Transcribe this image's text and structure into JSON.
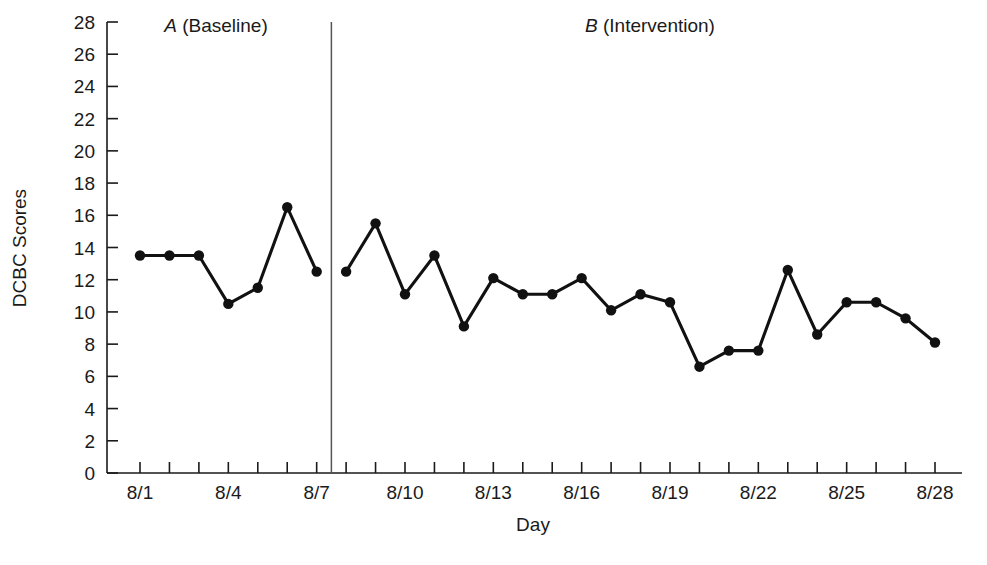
{
  "chart_data": {
    "type": "line",
    "title": "",
    "xlabel": "Day",
    "ylabel": "DCBC Scores",
    "ylim": [
      0,
      28
    ],
    "ytick_step": 2,
    "yticks": [
      0,
      2,
      4,
      6,
      8,
      10,
      12,
      14,
      16,
      18,
      20,
      22,
      24,
      26,
      28
    ],
    "ytick_labels": [
      "0",
      "2",
      "4",
      "6",
      "8",
      "10",
      "12",
      "14",
      "16",
      "18",
      "20",
      "22",
      "24",
      "26",
      "28"
    ],
    "x": [
      "8/1",
      "8/2",
      "8/3",
      "8/4",
      "8/5",
      "8/6",
      "8/7",
      "8/8",
      "8/9",
      "8/10",
      "8/11",
      "8/12",
      "8/13",
      "8/14",
      "8/15",
      "8/16",
      "8/17",
      "8/18",
      "8/19",
      "8/20",
      "8/21",
      "8/22",
      "8/23",
      "8/24",
      "8/25",
      "8/26",
      "8/27",
      "8/28"
    ],
    "xtick_labels": [
      "8/1",
      "",
      "",
      "8/4",
      "",
      "",
      "8/7",
      "",
      "",
      "8/10",
      "",
      "",
      "8/13",
      "",
      "",
      "8/16",
      "",
      "",
      "8/19",
      "",
      "",
      "8/22",
      "",
      "",
      "8/25",
      "",
      "",
      "8/28"
    ],
    "grid": false,
    "legend": false,
    "marker": "filled-circle",
    "line_color": "#111111",
    "marker_color": "#111111",
    "series": [
      {
        "name": "A (Baseline)",
        "phase": "A",
        "x": [
          "8/1",
          "8/2",
          "8/3",
          "8/4",
          "8/5",
          "8/6",
          "8/7"
        ],
        "values": [
          13.5,
          13.5,
          13.5,
          10.5,
          11.5,
          16.5,
          12.5
        ]
      },
      {
        "name": "B (Intervention)",
        "phase": "B",
        "x": [
          "8/8",
          "8/9",
          "8/10",
          "8/11",
          "8/12",
          "8/13",
          "8/14",
          "8/15",
          "8/16",
          "8/17",
          "8/18",
          "8/19",
          "8/20",
          "8/21",
          "8/22",
          "8/23",
          "8/24",
          "8/25",
          "8/26",
          "8/27",
          "8/28"
        ],
        "values": [
          12.5,
          15.5,
          11.1,
          13.5,
          9.1,
          12.1,
          11.1,
          11.1,
          12.1,
          10.1,
          11.1,
          10.6,
          6.6,
          7.6,
          7.6,
          12.6,
          8.6,
          10.6,
          10.6,
          9.6,
          8.1
        ]
      }
    ],
    "phase_line": {
      "between": [
        "8/7",
        "8/8"
      ],
      "color": "#555555"
    },
    "annotations": [
      {
        "id": "phase-a",
        "italic_part": "A",
        "roman_part": " (Baseline)",
        "full_text": "A (Baseline)"
      },
      {
        "id": "phase-b",
        "italic_part": "B",
        "roman_part": " (Intervention)",
        "full_text": "B (Intervention)"
      }
    ]
  }
}
